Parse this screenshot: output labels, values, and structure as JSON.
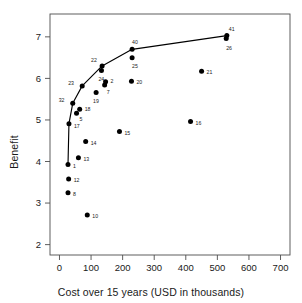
{
  "chart_data": {
    "type": "scatter",
    "title": "",
    "xlabel": "Cost over 15 years (USD in thousands)",
    "ylabel": "Benefit",
    "xlim": [
      -30,
      730
    ],
    "ylim": [
      1.75,
      7.55
    ],
    "xticks": [
      0,
      100,
      200,
      300,
      400,
      500,
      600,
      700
    ],
    "yticks": [
      2,
      3,
      4,
      5,
      6,
      7
    ],
    "grid": false,
    "legend": null,
    "point_label_field": "label",
    "points": [
      {
        "label": "1",
        "x": 27,
        "y": 3.93,
        "on_frontier": true,
        "label_dx": 5,
        "label_dy": 4
      },
      {
        "label": "12",
        "x": 29,
        "y": 3.58,
        "on_frontier": false,
        "label_dx": 5,
        "label_dy": 3
      },
      {
        "label": "8",
        "x": 27,
        "y": 3.25,
        "on_frontier": false,
        "label_dx": 5,
        "label_dy": 3
      },
      {
        "label": "10",
        "x": 88,
        "y": 2.71,
        "on_frontier": false,
        "label_dx": 5,
        "label_dy": 3
      },
      {
        "label": "13",
        "x": 60,
        "y": 4.09,
        "on_frontier": false,
        "label_dx": 5,
        "label_dy": 3
      },
      {
        "label": "14",
        "x": 83,
        "y": 4.48,
        "on_frontier": false,
        "label_dx": 5,
        "label_dy": 3
      },
      {
        "label": "15",
        "x": 190,
        "y": 4.72,
        "on_frontier": false,
        "label_dx": 5,
        "label_dy": 3
      },
      {
        "label": "16",
        "x": 415,
        "y": 4.96,
        "on_frontier": false,
        "label_dx": 5,
        "label_dy": 3
      },
      {
        "label": "17",
        "x": 30,
        "y": 4.91,
        "on_frontier": true,
        "label_dx": 5,
        "label_dy": 4
      },
      {
        "label": "5",
        "x": 54,
        "y": 5.16,
        "on_frontier": false,
        "label_dx": 3,
        "label_dy": 8
      },
      {
        "label": "18",
        "x": 64,
        "y": 5.26,
        "on_frontier": false,
        "label_dx": 5,
        "label_dy": 2
      },
      {
        "label": "32",
        "x": 42,
        "y": 5.4,
        "on_frontier": true,
        "label_dx": -14,
        "label_dy": -1
      },
      {
        "label": "19",
        "x": 116,
        "y": 5.66,
        "on_frontier": false,
        "label_dx": -3,
        "label_dy": 10
      },
      {
        "label": "23",
        "x": 72,
        "y": 5.82,
        "on_frontier": true,
        "label_dx": -14,
        "label_dy": -1
      },
      {
        "label": "7",
        "x": 143,
        "y": 5.84,
        "on_frontier": false,
        "label_dx": 2,
        "label_dy": 9
      },
      {
        "label": "2",
        "x": 146,
        "y": 5.92,
        "on_frontier": false,
        "label_dx": 5,
        "label_dy": 1
      },
      {
        "label": "20",
        "x": 228,
        "y": 5.93,
        "on_frontier": false,
        "label_dx": 5,
        "label_dy": 3
      },
      {
        "label": "21",
        "x": 450,
        "y": 6.17,
        "on_frontier": false,
        "label_dx": 5,
        "label_dy": 3
      },
      {
        "label": "24",
        "x": 133,
        "y": 6.19,
        "on_frontier": false,
        "label_dx": -3,
        "label_dy": 10
      },
      {
        "label": "22",
        "x": 135,
        "y": 6.3,
        "on_frontier": true,
        "label_dx": -11,
        "label_dy": -4
      },
      {
        "label": "25",
        "x": 230,
        "y": 6.5,
        "on_frontier": false,
        "label_dx": 0,
        "label_dy": 10
      },
      {
        "label": "40",
        "x": 230,
        "y": 6.7,
        "on_frontier": true,
        "label_dx": 0,
        "label_dy": -5
      },
      {
        "label": "26",
        "x": 528,
        "y": 6.96,
        "on_frontier": false,
        "label_dx": 0,
        "label_dy": 11
      },
      {
        "label": "41",
        "x": 530,
        "y": 7.03,
        "on_frontier": true,
        "label_dx": 2,
        "label_dy": -5
      }
    ],
    "frontier_line": {
      "name": "efficiency frontier",
      "points": [
        {
          "x": 27,
          "y": 3.93
        },
        {
          "x": 30,
          "y": 4.91
        },
        {
          "x": 42,
          "y": 5.4
        },
        {
          "x": 72,
          "y": 5.82
        },
        {
          "x": 135,
          "y": 6.3
        },
        {
          "x": 230,
          "y": 6.7
        },
        {
          "x": 530,
          "y": 7.03
        }
      ]
    },
    "colors": {
      "point": "#000000",
      "line": "#000000",
      "axis": "#4d4d4d",
      "text": "#1a1a1a",
      "background": "#ffffff"
    }
  }
}
